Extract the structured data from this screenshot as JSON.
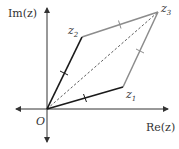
{
  "diagram": {
    "axes": {
      "real_label": "Re(z)",
      "imag_label": "Im(z)",
      "origin_label": "O"
    },
    "points": {
      "origin": {
        "label": "O",
        "x": 47,
        "y": 109
      },
      "z1": {
        "label": "z",
        "sub": "1",
        "x": 123,
        "y": 87
      },
      "z2": {
        "label": "z",
        "sub": "2",
        "x": 82,
        "y": 37
      },
      "z3": {
        "label": "z",
        "sub": "3",
        "x": 158,
        "y": 12
      }
    },
    "colors": {
      "axis": "#333333",
      "vector": "#1a1a1a",
      "parallel_side": "#8c8c8c",
      "diagonal": "#333333"
    },
    "labels": {
      "re": "Re(z)",
      "im": "Im(z)",
      "o": "O",
      "z1_main": "z",
      "z1_sub": "1",
      "z2_main": "z",
      "z2_sub": "2",
      "z3_main": "z",
      "z3_sub": "3"
    }
  }
}
